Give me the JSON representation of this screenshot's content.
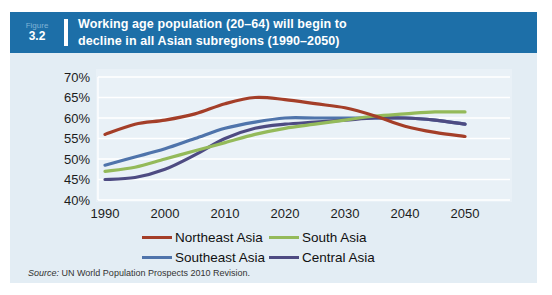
{
  "figure": {
    "label": "Figure",
    "number": "3.2"
  },
  "title": {
    "line1": "Working age population (20–64) will begin to",
    "line2": "decline in all Asian subregions (1990–2050)"
  },
  "source": {
    "label": "Source:",
    "text": " UN World Population Prospects 2010 Revision."
  },
  "colors": {
    "header_bar": "#1d6fa8",
    "panel_background": "#e3edf4",
    "plot_background": "#e9f1f7",
    "gridline": "#ffffff",
    "axis_text": "#1c1c1c"
  },
  "chart_data": {
    "type": "line",
    "x": [
      1990,
      1995,
      2000,
      2005,
      2010,
      2015,
      2020,
      2025,
      2030,
      2035,
      2040,
      2045,
      2050
    ],
    "xticks": [
      1990,
      2000,
      2010,
      2020,
      2030,
      2040,
      2050
    ],
    "ylim": [
      40,
      70
    ],
    "ytick_step": 5,
    "ytick_suffix": "%",
    "xlabel": "",
    "ylabel": "",
    "grid": true,
    "legend_position": "bottom",
    "title": "Working age population (20–64) will begin to decline in all Asian subregions (1990–2050)",
    "series": [
      {
        "name": "Northeast Asia",
        "color": "#a43e28",
        "values": [
          56,
          58.5,
          59.5,
          61,
          63.5,
          65,
          64.5,
          63.5,
          62.5,
          60.5,
          58,
          56.5,
          55.5
        ]
      },
      {
        "name": "South Asia",
        "color": "#94ba5a",
        "values": [
          47,
          48,
          50,
          52,
          54,
          56,
          57.5,
          58.5,
          59.5,
          60.5,
          61,
          61.5,
          61.5
        ]
      },
      {
        "name": "Southeast Asia",
        "color": "#4f74ab",
        "values": [
          48.5,
          50.5,
          52.5,
          55,
          57.5,
          59,
          60,
          60,
          60,
          60,
          60,
          59.5,
          58.5
        ]
      },
      {
        "name": "Central Asia",
        "color": "#4e4b82",
        "values": [
          45,
          45.5,
          47.5,
          51,
          55,
          57.5,
          58.5,
          59,
          59.5,
          60,
          60,
          59.5,
          58.5
        ]
      }
    ],
    "draw_order": [
      2,
      3,
      1,
      0
    ],
    "legend_rows": [
      [
        0,
        1
      ],
      [
        2,
        3
      ]
    ]
  }
}
